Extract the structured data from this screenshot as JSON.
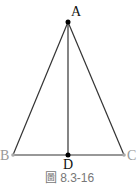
{
  "figure": {
    "caption": "圖 8.3-16",
    "points": {
      "A": {
        "label": "A",
        "x": 68,
        "y": 22
      },
      "B": {
        "label": "B",
        "x": 13,
        "y": 155
      },
      "C": {
        "label": "C",
        "x": 124,
        "y": 155
      },
      "D": {
        "label": "D",
        "x": 68,
        "y": 155
      }
    },
    "segments": [
      "AB",
      "AC",
      "BC",
      "AD"
    ],
    "colors": {
      "line": "#333333",
      "point": "#000000",
      "endpoint": "#aaaaaa"
    }
  }
}
